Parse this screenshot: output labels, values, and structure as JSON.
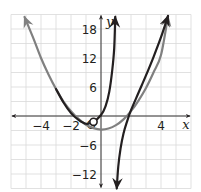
{
  "chart_data": {
    "type": "line",
    "title": "",
    "xlabel": "x",
    "ylabel": "y",
    "xlim": [
      -6,
      6
    ],
    "ylim": [
      -15,
      21
    ],
    "grid": true,
    "x_grid_step": 1,
    "y_grid_step": 3,
    "x_ticks": [
      {
        "value": -4,
        "label": "−4"
      },
      {
        "value": -2,
        "label": "−2"
      },
      {
        "value": 4,
        "label": "4"
      }
    ],
    "y_ticks": [
      {
        "value": 18,
        "label": "18"
      },
      {
        "value": 12,
        "label": "12"
      },
      {
        "value": 6,
        "label": "6"
      },
      {
        "value": -6,
        "label": "−6"
      },
      {
        "value": -12,
        "label": "−12"
      }
    ],
    "origin_label": "O",
    "series": [
      {
        "name": "gray-parabola",
        "color": "#808080",
        "points": [
          [
            -5.1,
            20.5
          ],
          [
            -4.5,
            16.0
          ],
          [
            -4,
            12.0
          ],
          [
            -3.5,
            8.6
          ],
          [
            -3,
            5.6
          ],
          [
            -2.5,
            3.0
          ],
          [
            -2,
            1.0
          ],
          [
            -1.5,
            -0.6
          ],
          [
            -1,
            -1.8
          ],
          [
            -0.5,
            -2.5
          ],
          [
            0,
            -2.8
          ],
          [
            0.5,
            -2.6
          ],
          [
            1,
            -1.9
          ],
          [
            1.5,
            -0.7
          ],
          [
            2,
            1.0
          ],
          [
            2.5,
            3.2
          ],
          [
            3,
            5.8
          ],
          [
            3.5,
            9.0
          ],
          [
            4,
            12.6
          ],
          [
            4.47,
            20.7
          ]
        ],
        "arrows": [
          "start",
          "end"
        ]
      },
      {
        "name": "black-left-branch",
        "color": "#231f20",
        "points": [
          [
            -3,
            5.6
          ],
          [
            -2.5,
            2.8
          ],
          [
            -2,
            0.6
          ],
          [
            -1.5,
            -0.8
          ],
          [
            -1,
            -1.6
          ],
          [
            -0.5,
            -1.2
          ],
          [
            0,
            0.2
          ],
          [
            0.3,
            2.0
          ],
          [
            0.55,
            5.0
          ],
          [
            0.75,
            9.5
          ],
          [
            0.88,
            14.0
          ],
          [
            0.95,
            20.5
          ]
        ],
        "arrows": [
          "end"
        ]
      },
      {
        "name": "black-right-branch",
        "color": "#231f20",
        "points": [
          [
            1.05,
            -15.0
          ],
          [
            1.15,
            -10.5
          ],
          [
            1.3,
            -6.8
          ],
          [
            1.5,
            -3.6
          ],
          [
            1.75,
            -1.0
          ],
          [
            2,
            1.2
          ],
          [
            2.5,
            4.8
          ],
          [
            3,
            8.4
          ],
          [
            3.5,
            12.2
          ],
          [
            4,
            16.3
          ],
          [
            4.47,
            20.7
          ]
        ],
        "arrows": [
          "start",
          "end"
        ]
      }
    ],
    "annotations": [
      {
        "type": "open-circle",
        "x": -0.5,
        "y": -1.2,
        "series": "black-left-branch"
      }
    ]
  }
}
